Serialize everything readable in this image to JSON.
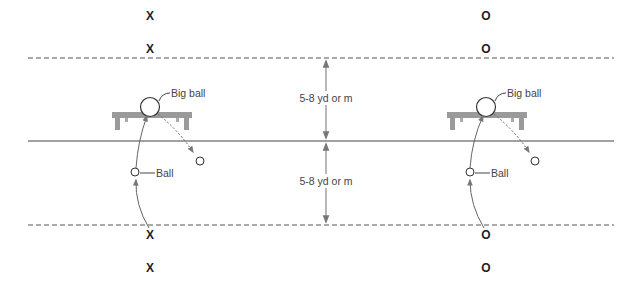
{
  "diagram": {
    "colors": {
      "line": "#444444",
      "dashed": "#555555",
      "bench": "#9a9a9a",
      "arrow": "#777777",
      "text": "#444444"
    },
    "lines": {
      "top_dashed_y": 58,
      "center_solid_y": 141,
      "bottom_dashed_y": 225,
      "x_start": 28,
      "x_end": 614
    },
    "distance_labels": [
      {
        "text": "5-8 yd or m",
        "position": "upper"
      },
      {
        "text": "5-8 yd or m",
        "position": "lower"
      }
    ],
    "stations": [
      {
        "team": "X",
        "players_top": [
          "X",
          "X"
        ],
        "players_bottom": [
          "X",
          "X"
        ],
        "big_ball_label": "Big ball",
        "ball_label": "Ball"
      },
      {
        "team": "O",
        "players_top": [
          "O",
          "O"
        ],
        "players_bottom": [
          "O",
          "O"
        ],
        "big_ball_label": "Big ball",
        "ball_label": "Ball"
      }
    ]
  }
}
